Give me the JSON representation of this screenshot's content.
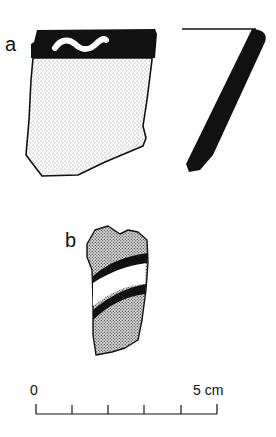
{
  "figure": {
    "sherds": [
      {
        "label": "a",
        "description": "rim sherd with black band and white wavy line, stippled body, with profile section"
      },
      {
        "label": "b",
        "description": "body sherd with two black bands enclosing a white band on dotted ground"
      }
    ],
    "scale_bar": {
      "start_label": "0",
      "end_label": "5 cm",
      "divisions": 5
    }
  },
  "colors": {
    "ink": "#111111",
    "background": "#ffffff",
    "stipple": "#bdbdbd",
    "dot_fill": "#8a8a8a"
  }
}
